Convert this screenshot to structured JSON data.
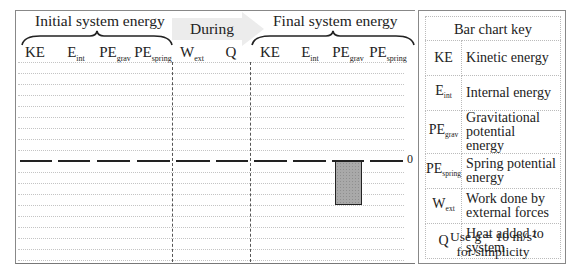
{
  "chart": {
    "group_titles": {
      "initial": "Initial system energy",
      "during": "During",
      "final": "Final system energy"
    },
    "columns": [
      {
        "id": "ke_i",
        "main": "KE",
        "sub": "",
        "group": "initial"
      },
      {
        "id": "eint_i",
        "main": "E",
        "sub": "int",
        "group": "initial"
      },
      {
        "id": "pegrav_i",
        "main": "PE",
        "sub": "grav",
        "group": "initial"
      },
      {
        "id": "pespring_i",
        "main": "PE",
        "sub": "spring",
        "group": "initial"
      },
      {
        "id": "wext",
        "main": "W",
        "sub": "ext",
        "group": "during"
      },
      {
        "id": "q",
        "main": "Q",
        "sub": "",
        "group": "during"
      },
      {
        "id": "ke_f",
        "main": "KE",
        "sub": "",
        "group": "final"
      },
      {
        "id": "eint_f",
        "main": "E",
        "sub": "int",
        "group": "final"
      },
      {
        "id": "pegrav_f",
        "main": "PE",
        "sub": "grav",
        "group": "final"
      },
      {
        "id": "pespring_f",
        "main": "PE",
        "sub": "spring",
        "group": "final"
      }
    ],
    "zero_label": "0"
  },
  "chart_data": {
    "type": "bar",
    "categories": [
      "KE (initial)",
      "E_int (initial)",
      "PE_grav (initial)",
      "PE_spring (initial)",
      "W_ext",
      "Q",
      "KE (final)",
      "E_int (final)",
      "PE_grav (final)",
      "PE_spring (final)"
    ],
    "values": [
      0,
      0,
      0,
      0,
      0,
      0,
      0,
      0,
      -4,
      0
    ],
    "xlabel": "",
    "ylabel": "",
    "ylim": [
      -9,
      9
    ],
    "grid": true,
    "unit_note": "grid units (unlabeled), only zero line labeled"
  },
  "key": {
    "title": "Bar chart key",
    "rows": [
      {
        "main": "KE",
        "sub": "",
        "desc": "Kinetic energy"
      },
      {
        "main": "E",
        "sub": "int",
        "desc": "Internal energy"
      },
      {
        "main": "PE",
        "sub": "grav",
        "desc": "Gravitational potential energy"
      },
      {
        "main": "PE",
        "sub": "spring",
        "desc": "Spring potential energy"
      },
      {
        "main": "W",
        "sub": "ext",
        "desc": "Work done by external forces"
      },
      {
        "main": "Q",
        "sub": "",
        "desc": "Heat added to system"
      }
    ],
    "note_line1": "Use g = 10 m/s²",
    "note_line2": "for simplicity"
  }
}
